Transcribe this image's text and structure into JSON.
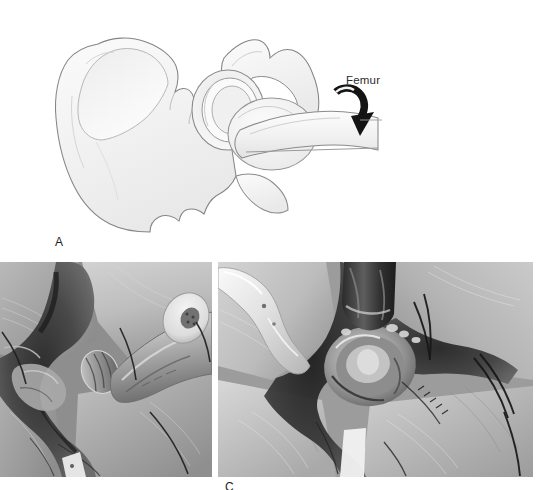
{
  "figure": {
    "kind": "surgical-technique-figure",
    "background_color": "#ffffff",
    "total_panels": 3
  },
  "panel_a": {
    "letter": "A",
    "type": "line-illustration",
    "subject": "pelvis-and-proximal-femur-lateral-view",
    "annotations": [
      {
        "name": "femur-label",
        "text": "Femur",
        "x": 346,
        "y": 74,
        "font_size_px": 11.5,
        "color": "#2b2b2b"
      }
    ],
    "rotation_arrow": {
      "name": "femur-rotation-arrow",
      "shape": "curved-hooked-arrow",
      "direction": "clockwise-downward",
      "color": "#141414"
    },
    "outline_color": "#808080",
    "fill_color": "#f4f4f4",
    "shade_color": "#e4e4e4",
    "structures": [
      "iliac-wing",
      "anterior-superior-iliac-spine",
      "anterior-inferior-iliac-spine",
      "acetabulum",
      "acetabular-rim",
      "ischium",
      "pubic-ramus",
      "greater-trochanter",
      "femoral-neck",
      "femoral-shaft"
    ]
  },
  "panel_b": {
    "letter": "B",
    "type": "intraoperative-photograph",
    "tone": "grayscale",
    "x": 0,
    "y": 262,
    "width": 212,
    "height": 215,
    "contents": [
      "powered-acetabular-reamer-handpiece",
      "reamer-basket-head",
      "surgical-drapes",
      "retracted-soft-tissue",
      "surgical-wound",
      "suture-strands"
    ],
    "letter_visible": false
  },
  "panel_c": {
    "letter": "C",
    "type": "intraoperative-photograph",
    "tone": "grayscale",
    "x": 218,
    "y": 262,
    "width": 315,
    "height": 215,
    "contents": [
      "metal-retractor-blade",
      "prepared-acetabular-socket",
      "acetabular-rim",
      "surgical-drapes",
      "retracted-soft-tissue",
      "suture-strands"
    ],
    "letter_visible": true,
    "letter_clipped_at_bottom": true,
    "letter_x": 225,
    "letter_y": 481
  }
}
